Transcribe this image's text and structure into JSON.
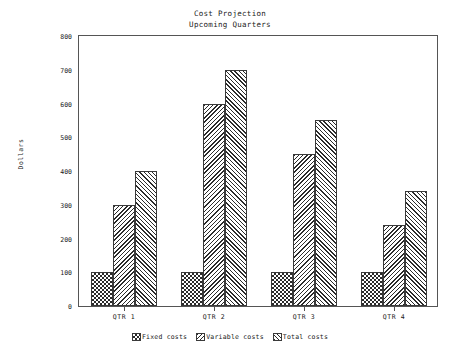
{
  "chart_data": {
    "type": "bar",
    "title": "Cost Projection",
    "subtitle": "Upcoming Quarters",
    "xlabel": "",
    "ylabel": "Dollars",
    "ylim": [
      0,
      800
    ],
    "ytick_step": 100,
    "grid": false,
    "legend_position": "bottom",
    "categories": [
      "QTR 1",
      "QTR 2",
      "QTR 3",
      "QTR 4"
    ],
    "series": [
      {
        "name": "Fixed costs",
        "pattern": "checker",
        "values": [
          100,
          100,
          100,
          100
        ]
      },
      {
        "name": "Variable costs",
        "pattern": "backslash",
        "values": [
          300,
          600,
          450,
          240
        ]
      },
      {
        "name": "Total costs",
        "pattern": "slash",
        "values": [
          400,
          700,
          550,
          340
        ]
      }
    ],
    "yticks": [
      "0",
      "100",
      "200",
      "300",
      "400",
      "500",
      "600",
      "700",
      "800"
    ],
    "colors": {
      "axis": "#555555",
      "bar_outline": "#3a3a3a",
      "pattern_ink": "#2b2b2b",
      "background": "#ffffff",
      "text": "#1a1a1a"
    }
  },
  "legend": {
    "items": [
      {
        "label": "Fixed costs"
      },
      {
        "label": "Variable costs"
      },
      {
        "label": "Total costs"
      }
    ]
  }
}
